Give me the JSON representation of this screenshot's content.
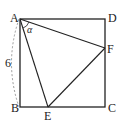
{
  "diagram": {
    "type": "geometry",
    "shape": "square ABCD with inscribed triangle AEF",
    "points": {
      "A": {
        "label": "A",
        "x": 20,
        "y": 19
      },
      "B": {
        "label": "B",
        "x": 20,
        "y": 107
      },
      "C": {
        "label": "C",
        "x": 105,
        "y": 107
      },
      "D": {
        "label": "D",
        "x": 105,
        "y": 19
      },
      "E": {
        "label": "E",
        "x": 48,
        "y": 107
      },
      "F": {
        "label": "F",
        "x": 105,
        "y": 48
      }
    },
    "side_length_label": "6",
    "angle_label": "α",
    "colors": {
      "line": "#222222",
      "dash": "#999999"
    }
  }
}
